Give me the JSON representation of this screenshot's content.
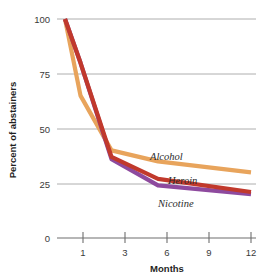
{
  "chart_data": {
    "type": "line",
    "title": "",
    "subtitle": "",
    "xlabel": "Months",
    "ylabel": "Percent of abstainers",
    "x": [
      0,
      1,
      3,
      6,
      12
    ],
    "xtick_labels": [
      "1",
      "3",
      "6",
      "9",
      "12"
    ],
    "xtick_values": [
      1,
      3,
      6,
      9,
      12
    ],
    "ytick_labels": [
      "0",
      "25",
      "50",
      "75",
      "100"
    ],
    "ytick_values": [
      0,
      25,
      50,
      75,
      100
    ],
    "ylim": [
      0,
      100
    ],
    "xlim": [
      0,
      12
    ],
    "grid": "horizontal",
    "legend": "inline-series-labels",
    "series": [
      {
        "name": "Alcohol",
        "color": "#e8a45c",
        "x": [
          0,
          1,
          3,
          6,
          12
        ],
        "values": [
          100,
          65,
          40,
          35,
          30
        ],
        "label_x": 12,
        "label_y": 38
      },
      {
        "name": "Heroin",
        "color": "#c1392c",
        "x": [
          0,
          1,
          3,
          6,
          12
        ],
        "values": [
          100,
          80,
          37,
          27,
          21
        ],
        "label_x": 12,
        "label_y": 28
      },
      {
        "name": "Nicotine",
        "color": "#8e4a9e",
        "x": [
          0,
          1,
          3,
          6,
          12
        ],
        "values": [
          100,
          80,
          36,
          24,
          20
        ],
        "label_x": 12,
        "label_y": 19
      }
    ]
  },
  "axes": {
    "ylabel": "Percent of abstainers",
    "xlabel": "Months",
    "ytick_0": "0",
    "ytick_25": "25",
    "ytick_50": "50",
    "ytick_75": "75",
    "ytick_100": "100",
    "xtick_1": "1",
    "xtick_3": "3",
    "xtick_6": "6",
    "xtick_9": "9",
    "xtick_12": "12"
  },
  "series_labels": {
    "alcohol": "Alcohol",
    "heroin": "Heroin",
    "nicotine": "Nicotine"
  },
  "colors": {
    "alcohol": "#e8a45c",
    "heroin": "#c1392c",
    "nicotine": "#8e4a9e",
    "grid": "#9a9a9a",
    "axis": "#6e6e6e",
    "text": "#2b2b2b",
    "background": "#ffffff"
  }
}
